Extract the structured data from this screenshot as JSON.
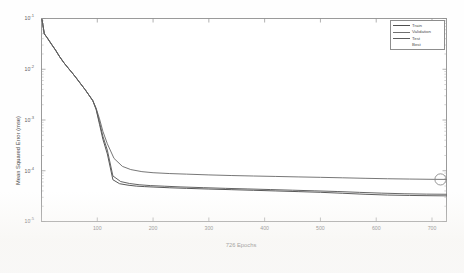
{
  "chart_data": {
    "type": "line",
    "title": "",
    "xlabel": "726 Epochs",
    "ylabel": "Mean Squared Error  (mse)",
    "xlim": [
      0,
      726
    ],
    "ylim": [
      1e-05,
      0.1
    ],
    "yscale": "log",
    "grid": false,
    "legend_position": "top-right",
    "xticks": [
      100,
      200,
      300,
      400,
      500,
      600,
      700
    ],
    "xtick_labels": [
      "100",
      "200",
      "300",
      "400",
      "500",
      "600",
      "700"
    ],
    "yticks": [
      1e-05,
      0.0001,
      0.001,
      0.01,
      0.1
    ],
    "ytick_labels": [
      "10",
      "10",
      "10",
      "10",
      "10"
    ],
    "ytick_exponents": [
      "-5",
      "-4",
      "-3",
      "-2",
      "-1"
    ],
    "series": [
      {
        "name": "Train",
        "color": "#4f4f4f",
        "x": [
          1,
          5,
          10,
          18,
          25,
          32,
          40,
          48,
          55,
          62,
          70,
          78,
          85,
          92,
          98,
          104,
          110,
          118,
          128,
          140,
          155,
          170,
          185,
          200,
          230,
          260,
          300,
          340,
          380,
          420,
          460,
          500,
          540,
          580,
          620,
          660,
          700,
          726
        ],
        "y": [
          0.095,
          0.05,
          0.042,
          0.031,
          0.024,
          0.018,
          0.0135,
          0.0105,
          0.0085,
          0.0068,
          0.0052,
          0.004,
          0.0031,
          0.0024,
          0.0016,
          0.00082,
          0.00042,
          0.000215,
          6.65e-05,
          5.55e-05,
          5.2e-05,
          4.98e-05,
          4.87e-05,
          4.78e-05,
          4.62e-05,
          4.5e-05,
          4.36e-05,
          4.24e-05,
          4.12e-05,
          4e-05,
          3.88e-05,
          3.76e-05,
          3.6e-05,
          3.44e-05,
          3.32e-05,
          3.26e-05,
          3.22e-05,
          3.2e-05
        ]
      },
      {
        "name": "Validation",
        "color": "#707070",
        "x": [
          1,
          5,
          10,
          18,
          25,
          32,
          40,
          48,
          55,
          62,
          70,
          78,
          85,
          92,
          98,
          104,
          110,
          118,
          130,
          145,
          160,
          180,
          200,
          230,
          260,
          300,
          340,
          380,
          420,
          460,
          500,
          540,
          580,
          620,
          660,
          700,
          726
        ],
        "y": [
          0.095,
          0.05,
          0.042,
          0.031,
          0.024,
          0.018,
          0.0135,
          0.0105,
          0.0085,
          0.0068,
          0.0052,
          0.004,
          0.0031,
          0.0024,
          0.0017,
          0.00105,
          0.0006,
          0.00034,
          0.000175,
          0.000122,
          0.0001055,
          9.6e-05,
          9.15e-05,
          8.8e-05,
          8.58e-05,
          8.28e-05,
          8.05e-05,
          7.88e-05,
          7.72e-05,
          7.56e-05,
          7.42e-05,
          7.26e-05,
          7.1e-05,
          6.96e-05,
          6.86e-05,
          6.78e-05,
          6.75e-05
        ]
      },
      {
        "name": "Test",
        "color": "#5c5c5c",
        "x": [
          1,
          5,
          10,
          18,
          25,
          32,
          40,
          48,
          55,
          62,
          70,
          78,
          85,
          92,
          98,
          104,
          110,
          118,
          128,
          142,
          158,
          175,
          195,
          220,
          250,
          290,
          330,
          370,
          410,
          450,
          490,
          530,
          570,
          610,
          650,
          690,
          726
        ],
        "y": [
          0.095,
          0.05,
          0.042,
          0.031,
          0.024,
          0.018,
          0.0135,
          0.0105,
          0.0085,
          0.0068,
          0.0052,
          0.004,
          0.0031,
          0.0024,
          0.00165,
          0.0009,
          0.00048,
          0.000255,
          7.9e-05,
          6.12e-05,
          5.6e-05,
          5.3e-05,
          5.1e-05,
          4.96e-05,
          4.8e-05,
          4.64e-05,
          4.5e-05,
          4.38e-05,
          4.26e-05,
          4.14e-05,
          4.02e-05,
          3.9e-05,
          3.75e-05,
          3.62e-05,
          3.52e-05,
          3.46e-05,
          3.44e-05
        ]
      }
    ],
    "best_marker": {
      "name": "Best",
      "color": "#8a8a8a",
      "x": 726,
      "y": 6.75e-05
    }
  },
  "legend": {
    "items": [
      {
        "label": "Train",
        "color": "#4f4f4f"
      },
      {
        "label": "Validation",
        "color": "#707070"
      },
      {
        "label": "Test",
        "color": "#5c5c5c"
      },
      {
        "label": "Best",
        "color": "#ffffff"
      }
    ]
  },
  "axes": {
    "x_title": "726 Epochs",
    "y_title": "Mean Squared Error  (mse)"
  }
}
